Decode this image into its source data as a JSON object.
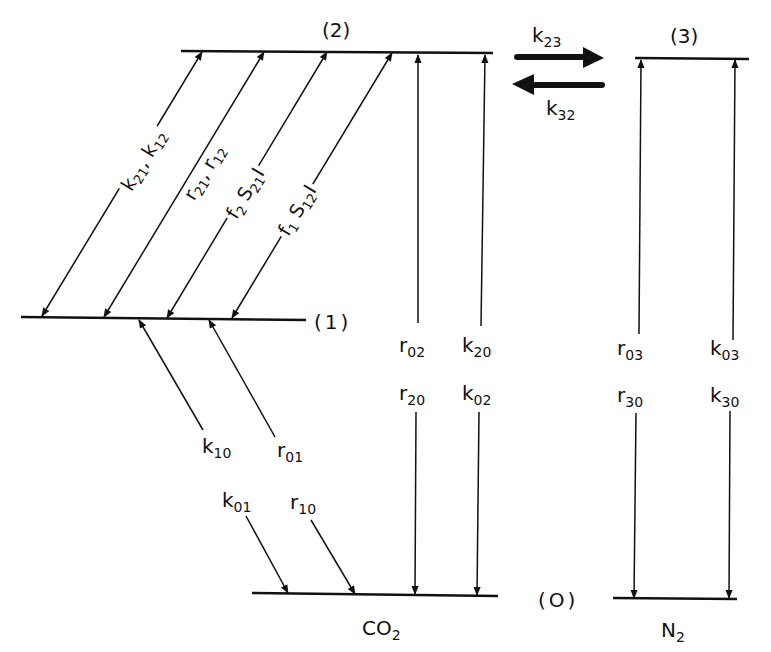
{
  "diagram": {
    "type": "energy-level-diagram",
    "levels": [
      {
        "id": "level-2",
        "label": "(2)"
      },
      {
        "id": "level-3",
        "label": "(3)"
      },
      {
        "id": "level-1",
        "label": "(1)"
      },
      {
        "id": "level-0",
        "label": "(O)"
      }
    ],
    "species": {
      "co2": {
        "base": "CO",
        "sub": "2"
      },
      "n2": {
        "base": "N",
        "sub": "2"
      }
    },
    "transfer": {
      "k23": {
        "base": "k",
        "sub": "23"
      },
      "k32": {
        "base": "k",
        "sub": "32"
      }
    },
    "diagonal_labels": {
      "k21_k12": {
        "a": "k",
        "a_sub": "21",
        "sep": ", ",
        "b": "k",
        "b_sub": "12"
      },
      "r21_r12": {
        "a": "r",
        "a_sub": "21",
        "sep": ", ",
        "b": "r",
        "b_sub": "12"
      },
      "f2_s21_i": {
        "a": "f",
        "a_sub": "2",
        "sep": " ",
        "b": "S",
        "b_sub": "21",
        "c": "I"
      },
      "f1_s12_i": {
        "a": "f",
        "a_sub": "1",
        "sep": " ",
        "b": "S",
        "b_sub": "12",
        "c": "I"
      }
    },
    "level1_to_0": {
      "k10": {
        "base": "k",
        "sub": "10"
      },
      "r01": {
        "base": "r",
        "sub": "01"
      },
      "k01": {
        "base": "k",
        "sub": "01"
      },
      "r10": {
        "base": "r",
        "sub": "10"
      }
    },
    "co2_vertical": {
      "r02": {
        "base": "r",
        "sub": "02"
      },
      "k20": {
        "base": "k",
        "sub": "20"
      },
      "r20": {
        "base": "r",
        "sub": "20"
      },
      "k02": {
        "base": "k",
        "sub": "02"
      }
    },
    "n2_vertical": {
      "r03": {
        "base": "r",
        "sub": "03"
      },
      "k03": {
        "base": "k",
        "sub": "03"
      },
      "r30": {
        "base": "r",
        "sub": "30"
      },
      "k30": {
        "base": "k",
        "sub": "30"
      }
    },
    "colors": {
      "ink": "#111111",
      "background": "#ffffff"
    }
  }
}
